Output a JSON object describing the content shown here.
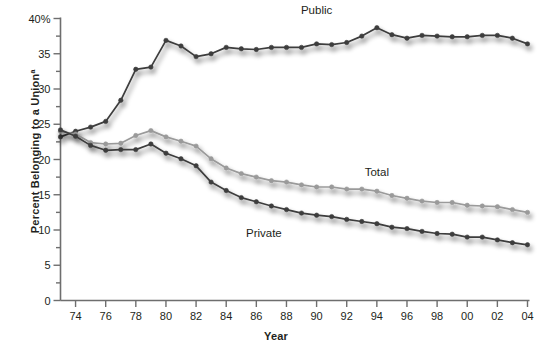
{
  "chart_data": {
    "type": "line",
    "title": "",
    "xlabel": "Year",
    "ylabel": "Percent Belonging to a Union",
    "ylabel_superscript": "a",
    "xlim": [
      1973,
      2004
    ],
    "ylim": [
      0,
      40
    ],
    "grid": false,
    "legend_position": "inline-annotations",
    "y_ticks_major": [
      "0",
      "5",
      "10",
      "15",
      "20",
      "25",
      "30",
      "35",
      "40%"
    ],
    "y_tick_values": [
      0,
      5,
      10,
      15,
      20,
      25,
      30,
      35,
      40
    ],
    "y_minor_tick_interval": 2.5,
    "x_ticks": [
      "74",
      "76",
      "78",
      "80",
      "82",
      "84",
      "86",
      "88",
      "90",
      "92",
      "94",
      "96",
      "98",
      "00",
      "02",
      "04"
    ],
    "x_tick_values": [
      1974,
      1976,
      1978,
      1980,
      1982,
      1984,
      1986,
      1988,
      1990,
      1992,
      1994,
      1996,
      1998,
      2000,
      2002,
      2004
    ],
    "x": [
      1973,
      1974,
      1975,
      1976,
      1977,
      1978,
      1979,
      1980,
      1981,
      1982,
      1983,
      1984,
      1985,
      1986,
      1987,
      1988,
      1989,
      1990,
      1991,
      1992,
      1993,
      1994,
      1995,
      1996,
      1997,
      1998,
      1999,
      2000,
      2001,
      2002,
      2003,
      2004
    ],
    "series": [
      {
        "name": "Public",
        "color": "#3d3d3d",
        "values": [
          23.2,
          24.0,
          24.6,
          25.4,
          28.4,
          32.8,
          33.1,
          36.9,
          36.1,
          34.6,
          35.0,
          35.9,
          35.7,
          35.6,
          35.9,
          35.9,
          35.9,
          36.4,
          36.3,
          36.6,
          37.5,
          38.7,
          37.7,
          37.2,
          37.6,
          37.5,
          37.4,
          37.4,
          37.6,
          37.6,
          37.2,
          36.4
        ]
      },
      {
        "name": "Total",
        "color": "#9a9a9a",
        "values": [
          24.0,
          23.6,
          22.4,
          22.2,
          22.3,
          23.4,
          24.1,
          23.2,
          22.6,
          21.9,
          20.1,
          18.8,
          18.0,
          17.5,
          17.0,
          16.8,
          16.4,
          16.1,
          16.1,
          15.8,
          15.8,
          15.5,
          14.9,
          14.5,
          14.1,
          13.9,
          13.9,
          13.5,
          13.4,
          13.3,
          12.9,
          12.5
        ]
      },
      {
        "name": "Private",
        "color": "#3d3d3d",
        "values": [
          24.2,
          23.3,
          22.0,
          21.3,
          21.4,
          21.4,
          22.2,
          20.9,
          20.1,
          19.1,
          16.8,
          15.6,
          14.6,
          14.0,
          13.4,
          12.9,
          12.4,
          12.1,
          11.9,
          11.5,
          11.2,
          10.9,
          10.4,
          10.2,
          9.8,
          9.5,
          9.4,
          9.0,
          9.0,
          8.6,
          8.2,
          7.9
        ]
      }
    ],
    "annotations": [
      {
        "text": "Public",
        "x": 1990.0,
        "y": 40.9
      },
      {
        "text": "Total",
        "x": 1994.0,
        "y": 17.9
      },
      {
        "text": "Private",
        "x": 1986.5,
        "y": 9.3
      }
    ]
  }
}
